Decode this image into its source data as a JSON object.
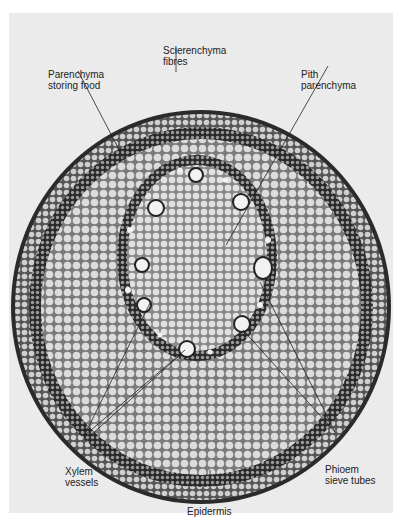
{
  "figure": {
    "type": "micrograph",
    "background_color": "#ebebeb",
    "labels": [
      {
        "id": "sclerenchyma",
        "lines": [
          "Sclerenchyma",
          "fibres"
        ]
      },
      {
        "id": "parenchyma",
        "lines": [
          "Parenchyma",
          "storing food"
        ]
      },
      {
        "id": "pith",
        "lines": [
          "Pith",
          "parenchyma"
        ]
      },
      {
        "id": "xylem",
        "lines": [
          "Xylem",
          "vessels"
        ]
      },
      {
        "id": "phloem",
        "lines": [
          "Phioem",
          "sieve tubes"
        ]
      },
      {
        "id": "epidermis",
        "lines": [
          "Epidermis"
        ]
      }
    ]
  }
}
